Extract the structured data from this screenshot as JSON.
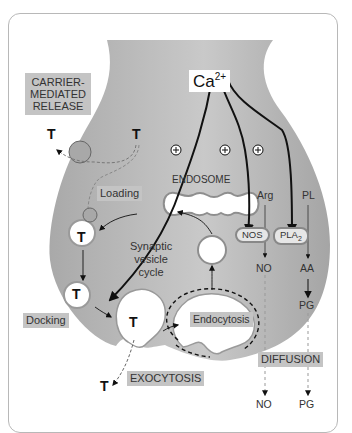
{
  "diagram": {
    "colors": {
      "terminal_fill": "#b0b0b0",
      "label_box": "#c4c4c4",
      "arrow": "#111111",
      "vesicle_fill": "#ffffff"
    },
    "labels": {
      "calcium": "Ca",
      "calcium_charge": "2+",
      "carrier_line1": "CARRIER-",
      "carrier_line2": "MEDIATED",
      "carrier_line3": "RELEASE",
      "loading": "Loading",
      "endosome": "ENDOSOME",
      "cycle_line1": "Synaptic",
      "cycle_line2": "vesicle",
      "cycle_line3": "cycle",
      "docking": "Docking",
      "endocytosis": "Endocytosis",
      "exocytosis": "EXOCYTOSIS",
      "diffusion": "DIFFUSION",
      "arg": "Arg",
      "pl": "PL",
      "nos": "NOS",
      "pla": "PLA",
      "pla_sub": "2",
      "no_inside": "NO",
      "aa": "AA",
      "pg_inside": "PG",
      "no_outside": "NO",
      "pg_outside": "PG",
      "transmitter": "T",
      "plus": "+"
    },
    "nodes": [
      {
        "id": "ca",
        "label": "Ca2+"
      },
      {
        "id": "carrier",
        "label": "CARRIER-MEDIATED RELEASE"
      },
      {
        "id": "loading",
        "label": "Loading"
      },
      {
        "id": "endosome",
        "label": "ENDOSOME"
      },
      {
        "id": "cycle",
        "label": "Synaptic vesicle cycle"
      },
      {
        "id": "docking",
        "label": "Docking"
      },
      {
        "id": "endocytosis",
        "label": "Endocytosis"
      },
      {
        "id": "exocytosis",
        "label": "EXOCYTOSIS"
      },
      {
        "id": "diffusion",
        "label": "DIFFUSION"
      },
      {
        "id": "nos",
        "label": "NOS"
      },
      {
        "id": "pla2",
        "label": "PLA2"
      },
      {
        "id": "arg",
        "label": "Arg"
      },
      {
        "id": "pl",
        "label": "PL"
      },
      {
        "id": "no",
        "label": "NO"
      },
      {
        "id": "aa",
        "label": "AA"
      },
      {
        "id": "pg",
        "label": "PG"
      }
    ],
    "edges": [
      {
        "from": "ca",
        "to": "docking",
        "sign": "+"
      },
      {
        "from": "ca",
        "to": "nos",
        "sign": "+"
      },
      {
        "from": "ca",
        "to": "pla2",
        "sign": "+"
      },
      {
        "from": "arg",
        "to": "no",
        "via": "nos"
      },
      {
        "from": "pl",
        "to": "aa",
        "via": "pla2"
      },
      {
        "from": "aa",
        "to": "pg"
      },
      {
        "from": "no",
        "to": "no_outside",
        "style": "dashed"
      },
      {
        "from": "pg",
        "to": "pg_outside",
        "style": "dashed"
      },
      {
        "from": "endocytosis",
        "to": "vesicle"
      },
      {
        "from": "vesicle",
        "to": "endosome"
      },
      {
        "from": "endosome",
        "to": "loading"
      },
      {
        "from": "loading",
        "to": "docking"
      },
      {
        "from": "docking",
        "to": "exocytosis"
      }
    ]
  }
}
